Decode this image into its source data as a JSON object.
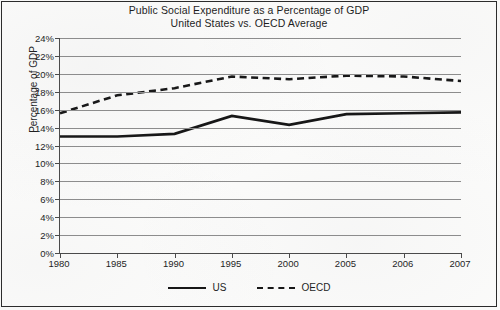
{
  "chart_data": {
    "type": "line",
    "title": "Public Social Expenditure as a Percentage of GDP",
    "subtitle": "United States vs. OECD Average",
    "xlabel": "",
    "ylabel": "Percentage of GDP",
    "categories": [
      "1980",
      "1985",
      "1990",
      "1995",
      "2000",
      "2005",
      "2006",
      "2007"
    ],
    "series": [
      {
        "name": "US",
        "style": "solid",
        "color": "#161616",
        "values": [
          13.0,
          13.0,
          13.3,
          15.3,
          14.3,
          15.5,
          15.6,
          15.7
        ]
      },
      {
        "name": "OECD",
        "style": "dashed",
        "color": "#161616",
        "values": [
          15.6,
          17.6,
          18.4,
          19.7,
          19.4,
          19.8,
          19.7,
          19.2
        ]
      }
    ],
    "ylim": [
      0,
      24
    ],
    "ytick_step": 2,
    "yticks": [
      "0%",
      "2%",
      "4%",
      "6%",
      "8%",
      "10%",
      "12%",
      "14%",
      "16%",
      "18%",
      "20%",
      "22%",
      "24%"
    ],
    "ytick_values": [
      0,
      2,
      4,
      6,
      8,
      10,
      12,
      14,
      16,
      18,
      20,
      22,
      24
    ],
    "grid": true,
    "legend_position": "bottom"
  },
  "legend": {
    "items": [
      {
        "label": "US",
        "style": "solid"
      },
      {
        "label": "OECD",
        "style": "dashed"
      }
    ]
  }
}
